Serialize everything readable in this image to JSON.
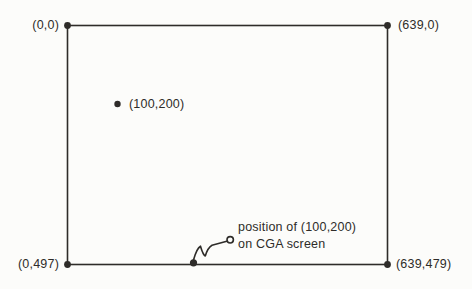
{
  "diagram": {
    "corners": {
      "top_left": "(0,0)",
      "top_right": "(639,0)",
      "bottom_left": "(0,497)",
      "bottom_right": "(639,479)"
    },
    "interior_point": {
      "label": "(100,200)"
    },
    "annotation": {
      "line1": "position of (100,200)",
      "line2": "on CGA screen"
    },
    "colors": {
      "ink": "#2e2c29",
      "paper": "#fcfcfa"
    }
  }
}
